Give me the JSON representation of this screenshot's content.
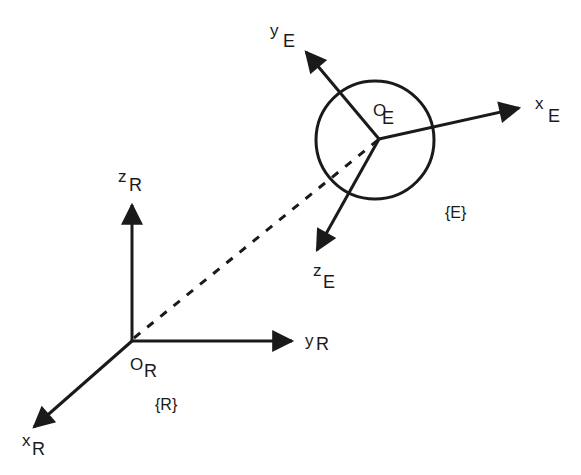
{
  "diagram": {
    "type": "coordinate-frames",
    "frames": [
      {
        "id": "R",
        "frame_label": "{R}",
        "origin": {
          "main": "O",
          "sub": "R"
        },
        "axes": [
          {
            "main": "x",
            "sub": "R"
          },
          {
            "main": "y",
            "sub": "R"
          },
          {
            "main": "z",
            "sub": "R"
          }
        ]
      },
      {
        "id": "E",
        "frame_label": "{E}",
        "origin": {
          "main": "O",
          "sub": "E"
        },
        "axes": [
          {
            "main": "x",
            "sub": "E"
          },
          {
            "main": "y",
            "sub": "E"
          },
          {
            "main": "z",
            "sub": "E"
          }
        ]
      }
    ],
    "connector": {
      "from": "O_R",
      "to": "O_E",
      "style": "dashed"
    },
    "colors": {
      "stroke": "#1a1a1a",
      "background": "#ffffff"
    }
  }
}
